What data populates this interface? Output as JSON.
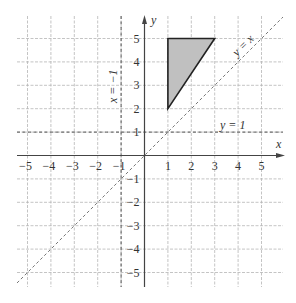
{
  "diagram": {
    "type": "coordinate-plane",
    "origin_px": [
      144.5,
      155.5
    ],
    "unit_px": 23.4,
    "x_range": [
      -5,
      5
    ],
    "y_range": [
      -5,
      5
    ],
    "grid_extent_px": {
      "left": 17,
      "right": 283,
      "top": 16,
      "bottom": 287
    },
    "axes": {
      "x_label": "x",
      "y_label": "y",
      "x_ticks": [
        {
          "value": -5,
          "label": "−5"
        },
        {
          "value": -4,
          "label": "−4"
        },
        {
          "value": -3,
          "label": "−3"
        },
        {
          "value": -2,
          "label": "−2"
        },
        {
          "value": -1,
          "label": "−1"
        },
        {
          "value": 1,
          "label": "1"
        },
        {
          "value": 2,
          "label": "2"
        },
        {
          "value": 3,
          "label": "3"
        },
        {
          "value": 4,
          "label": "4"
        },
        {
          "value": 5,
          "label": "5"
        }
      ],
      "y_ticks": [
        {
          "value": 5,
          "label": "5"
        },
        {
          "value": 4,
          "label": "4"
        },
        {
          "value": 3,
          "label": "3"
        },
        {
          "value": 2,
          "label": "2"
        },
        {
          "value": 1,
          "label": "1"
        },
        {
          "value": -1,
          "label": "−1"
        },
        {
          "value": -2,
          "label": "−2"
        },
        {
          "value": -3,
          "label": "−3"
        },
        {
          "value": -4,
          "label": "−4"
        },
        {
          "value": -5,
          "label": "−5"
        }
      ]
    },
    "lines": [
      {
        "name": "y-equals-x",
        "equation": "y = x",
        "label": "y = x",
        "style": "dashed"
      },
      {
        "name": "y-equals-1",
        "equation": "y = 1",
        "label": "y = 1",
        "style": "dashed"
      },
      {
        "name": "x-equals-minus-1",
        "equation": "x = −1",
        "label": "x = −1",
        "style": "dashed"
      }
    ],
    "shape": {
      "name": "triangle",
      "vertices": [
        [
          1,
          2
        ],
        [
          1,
          5
        ],
        [
          3,
          5
        ]
      ],
      "fill": "#c0c0c0",
      "stroke": "#222222"
    },
    "colors": {
      "grid": "#b5b5b5",
      "axis": "#444444",
      "guide_line": "#555555",
      "diagonal": "#777777"
    }
  }
}
